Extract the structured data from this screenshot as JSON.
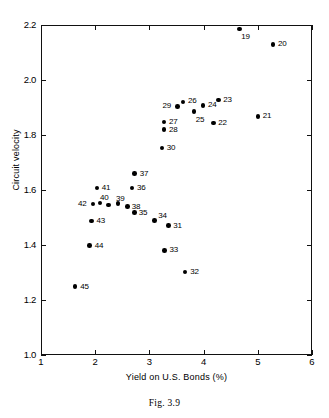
{
  "figure": {
    "caption": "Fig. 3.9"
  },
  "chart_data": {
    "type": "scatter",
    "title": "",
    "xlabel": "Yield on U.S. Bonds (%)",
    "ylabel": "Circuit velocity",
    "xlim": [
      1,
      6
    ],
    "ylim": [
      1.0,
      2.2
    ],
    "xticks": [
      "1",
      "2",
      "3",
      "4",
      "5",
      "6"
    ],
    "yticks": [
      "1.0",
      "1.2",
      "1.4",
      "1.6",
      "1.8",
      "2.0",
      "2.2"
    ],
    "grid": false,
    "legend": "none",
    "points": [
      {
        "label": "19",
        "x": 4.66,
        "y": 2.185,
        "lx": 2,
        "ly": 4
      },
      {
        "label": "20",
        "x": 5.28,
        "y": 2.13,
        "lx": 5,
        "ly": -4
      },
      {
        "label": "21",
        "x": 5.0,
        "y": 1.868,
        "lx": 5,
        "ly": -4
      },
      {
        "label": "22",
        "x": 4.18,
        "y": 1.843,
        "lx": 5,
        "ly": -4
      },
      {
        "label": "23",
        "x": 4.27,
        "y": 1.928,
        "lx": 5,
        "ly": -4
      },
      {
        "label": "24",
        "x": 3.99,
        "y": 1.908,
        "lx": 5,
        "ly": -4
      },
      {
        "label": "25",
        "x": 3.82,
        "y": 1.885,
        "lx": 2,
        "ly": 4
      },
      {
        "label": "26",
        "x": 3.62,
        "y": 1.92,
        "lx": 5,
        "ly": -5
      },
      {
        "label": "27",
        "x": 3.27,
        "y": 1.847,
        "lx": 5,
        "ly": -4
      },
      {
        "label": "28",
        "x": 3.27,
        "y": 1.82,
        "lx": 5,
        "ly": -4
      },
      {
        "label": "29",
        "x": 3.52,
        "y": 1.904,
        "lx": -15,
        "ly": -4
      },
      {
        "label": "30",
        "x": 3.23,
        "y": 1.753,
        "lx": 5,
        "ly": -4
      },
      {
        "label": "31",
        "x": 3.35,
        "y": 1.47,
        "lx": 5,
        "ly": -4
      },
      {
        "label": "32",
        "x": 3.66,
        "y": 1.302,
        "lx": 5,
        "ly": -4
      },
      {
        "label": "33",
        "x": 3.28,
        "y": 1.381,
        "lx": 5,
        "ly": -4
      },
      {
        "label": "34",
        "x": 3.09,
        "y": 1.49,
        "lx": 4,
        "ly": -8
      },
      {
        "label": "35",
        "x": 2.73,
        "y": 1.518,
        "lx": 4,
        "ly": -4
      },
      {
        "label": "36",
        "x": 2.68,
        "y": 1.607,
        "lx": 5,
        "ly": -4
      },
      {
        "label": "37",
        "x": 2.73,
        "y": 1.66,
        "lx": 5,
        "ly": -4
      },
      {
        "label": "38",
        "x": 2.6,
        "y": 1.54,
        "lx": 4,
        "ly": -4
      },
      {
        "label": "39",
        "x": 2.42,
        "y": 1.55,
        "lx": -2,
        "ly": -9
      },
      {
        "label": "40",
        "x": 2.09,
        "y": 1.553,
        "lx": 0,
        "ly": -9
      },
      {
        "label": "41",
        "x": 2.03,
        "y": 1.608,
        "lx": 5,
        "ly": -4
      },
      {
        "label": "42",
        "x": 1.96,
        "y": 1.549,
        "lx": -15,
        "ly": -4
      },
      {
        "label": "43",
        "x": 1.93,
        "y": 1.488,
        "lx": 5,
        "ly": -4
      },
      {
        "label": "44",
        "x": 1.9,
        "y": 1.398,
        "lx": 5,
        "ly": -4
      },
      {
        "label": "45",
        "x": 1.63,
        "y": 1.249,
        "lx": 5,
        "ly": -4
      },
      {
        "label": "",
        "x": 2.25,
        "y": 1.545,
        "lx": 0,
        "ly": 0
      }
    ]
  }
}
